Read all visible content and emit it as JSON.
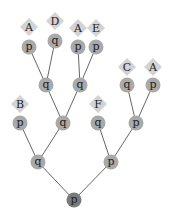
{
  "diagram": {
    "type": "tree",
    "colors": {
      "node": "#a9a9a9",
      "root": "#7a7a7a",
      "leaf_diamond": "#d3d3d3",
      "edge": "#555555",
      "text": "#222222"
    },
    "nodes": [
      {
        "id": "n0",
        "label": "p",
        "x": 74,
        "y": 200,
        "root": true
      },
      {
        "id": "n1",
        "label": "q",
        "x": 38,
        "y": 162
      },
      {
        "id": "n2",
        "label": "p",
        "x": 111,
        "y": 162
      },
      {
        "id": "n3",
        "label": "p",
        "x": 20,
        "y": 123
      },
      {
        "id": "n4",
        "label": "q",
        "x": 63,
        "y": 123
      },
      {
        "id": "n5",
        "label": "q",
        "x": 98,
        "y": 123
      },
      {
        "id": "n6",
        "label": "p",
        "x": 136,
        "y": 123
      },
      {
        "id": "n7",
        "label": "q",
        "x": 46,
        "y": 85
      },
      {
        "id": "n8",
        "label": "q",
        "x": 80,
        "y": 85
      },
      {
        "id": "n9",
        "label": "q",
        "x": 127,
        "y": 85
      },
      {
        "id": "n10",
        "label": "p",
        "x": 153,
        "y": 85
      },
      {
        "id": "n11",
        "label": "p",
        "x": 29,
        "y": 47
      },
      {
        "id": "n12",
        "label": "q",
        "x": 55,
        "y": 41
      },
      {
        "id": "n13",
        "label": "p",
        "x": 78,
        "y": 47
      },
      {
        "id": "n14",
        "label": "p",
        "x": 96,
        "y": 47
      }
    ],
    "leaves": [
      {
        "id": "l0",
        "label": "A",
        "x": 29,
        "y": 27
      },
      {
        "id": "l1",
        "label": "D",
        "x": 55,
        "y": 21
      },
      {
        "id": "l2",
        "label": "A",
        "x": 78,
        "y": 28
      },
      {
        "id": "l3",
        "label": "E",
        "x": 96,
        "y": 28
      },
      {
        "id": "l4",
        "label": "C",
        "x": 127,
        "y": 67
      },
      {
        "id": "l5",
        "label": "A",
        "x": 153,
        "y": 67
      },
      {
        "id": "l6",
        "label": "B",
        "x": 20,
        "y": 104
      },
      {
        "id": "l7",
        "label": "F",
        "x": 98,
        "y": 104
      }
    ],
    "edges": [
      [
        "n0",
        "n1"
      ],
      [
        "n0",
        "n2"
      ],
      [
        "n1",
        "n3"
      ],
      [
        "n1",
        "n4"
      ],
      [
        "n2",
        "n5"
      ],
      [
        "n2",
        "n6"
      ],
      [
        "n4",
        "n7"
      ],
      [
        "n4",
        "n8"
      ],
      [
        "n6",
        "n9"
      ],
      [
        "n6",
        "n10"
      ],
      [
        "n7",
        "n11"
      ],
      [
        "n7",
        "n12"
      ],
      [
        "n8",
        "n13"
      ],
      [
        "n8",
        "n14"
      ]
    ]
  }
}
